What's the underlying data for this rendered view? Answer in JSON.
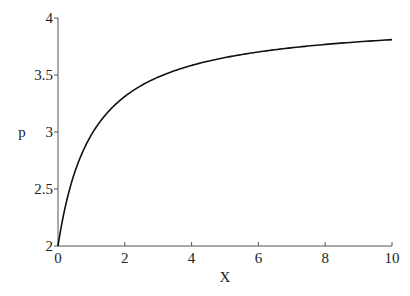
{
  "chart_data": {
    "type": "line",
    "title": "",
    "xlabel": "X",
    "ylabel": "p",
    "xlim": [
      0,
      10
    ],
    "ylim": [
      2,
      4
    ],
    "xticks": [
      "0",
      "2",
      "4",
      "6",
      "8",
      "10"
    ],
    "yticks": [
      "2",
      "2.5",
      "3",
      "3.5",
      "4"
    ],
    "grid": false,
    "series": [
      {
        "name": "p",
        "color": "#111111",
        "x": [
          0,
          0.1,
          0.25,
          0.5,
          0.75,
          1,
          1.5,
          2,
          2.5,
          3,
          4,
          5,
          6,
          7,
          8,
          9,
          10
        ],
        "values": [
          2.0,
          2.18,
          2.4,
          2.67,
          2.86,
          3.0,
          3.2,
          3.33,
          3.43,
          3.5,
          3.6,
          3.67,
          3.71,
          3.75,
          3.78,
          3.8,
          3.82
        ]
      }
    ]
  }
}
